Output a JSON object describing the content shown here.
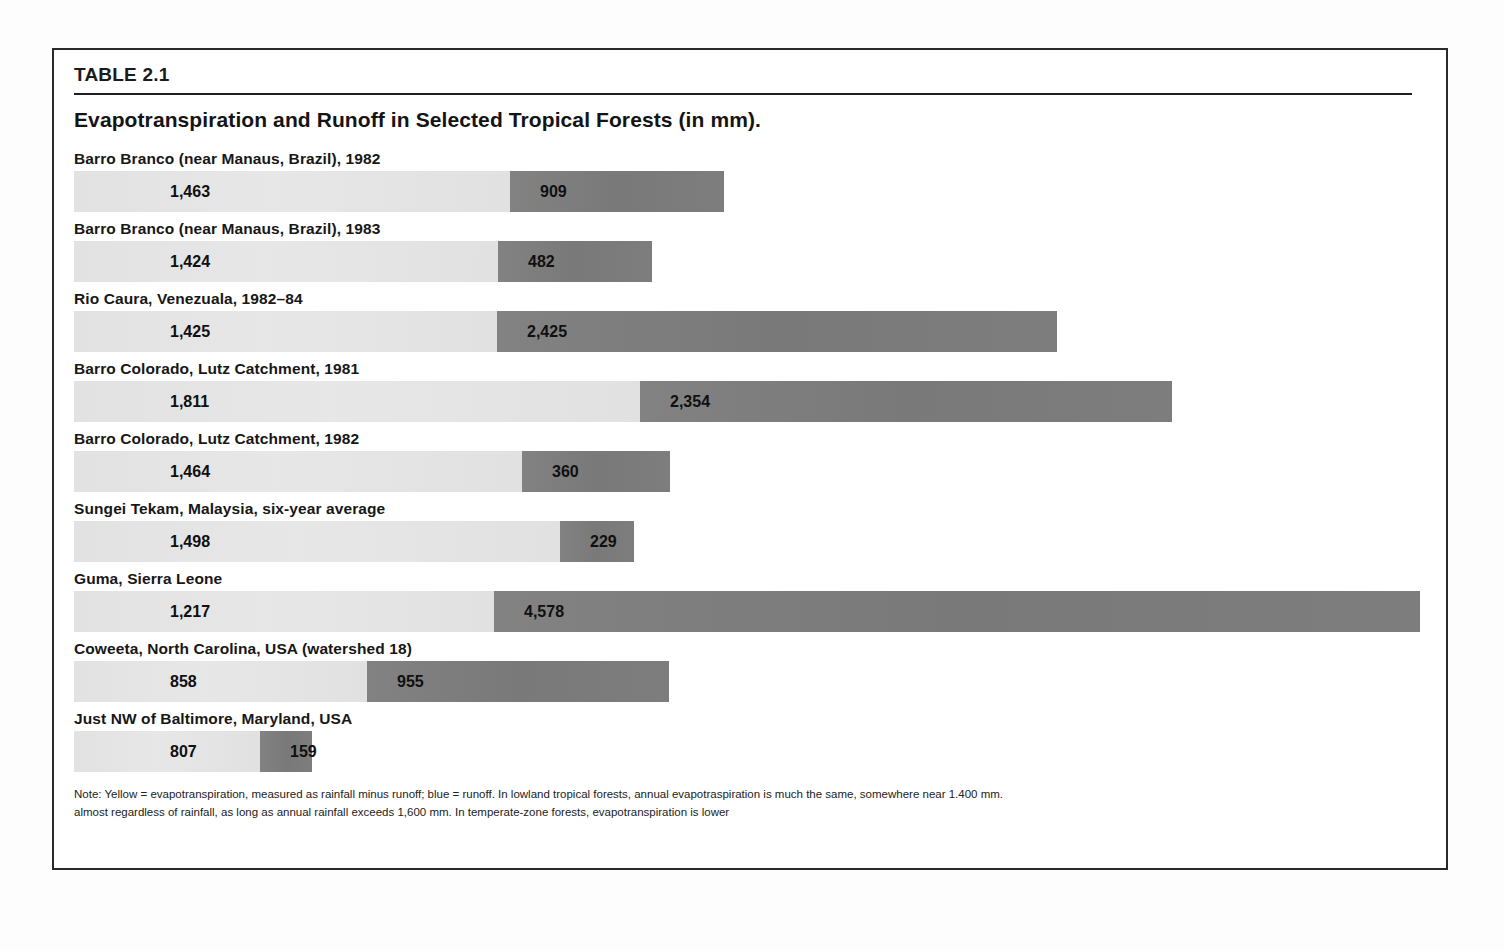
{
  "table": {
    "id_label": "TABLE 2.1",
    "title": "Evapotranspiration and Runoff in Selected Tropical Forests (in mm)."
  },
  "legend": {
    "evapotranspiration_color": "#e4e4e4",
    "runoff_color": "#7e7e7e"
  },
  "note": {
    "line1": "Note: Yellow = evapotranspiration, measured as rainfall minus runoff; blue = runoff. In lowland tropical forests, annual evapotraspiration is much the same, somewhere near 1.400 mm.",
    "line2": "almost regardless of rainfall, as long as annual rainfall exceeds 1,600 mm. In temperate-zone forests, evapotranspiration is lower"
  },
  "chart_data": {
    "type": "bar",
    "title": "Evapotranspiration and Runoff in Selected Tropical Forests (in mm).",
    "xlabel": "",
    "ylabel": "",
    "grid": false,
    "stacked": true,
    "orientation": "horizontal",
    "units": "mm",
    "legend": [
      "evapotranspiration",
      "runoff"
    ],
    "legend_position": "note",
    "categories": [
      "Barro Branco (near Manaus, Brazil), 1982",
      "Barro Branco (near Manaus, Brazil), 1983",
      "Rio Caura, Venezuala, 1982–84",
      "Barro Colorado, Lutz Catchment, 1981",
      "Barro Colorado, Lutz Catchment, 1982",
      "Sungei Tekam, Malaysia, six-year average",
      "Guma, Sierra Leone",
      "Coweeta, North Carolina, USA (watershed 18)",
      "Just NW of Baltimore, Maryland, USA"
    ],
    "series": [
      {
        "name": "evapotranspiration",
        "values": [
          1463,
          1424,
          1425,
          1811,
          1464,
          1498,
          1217,
          858,
          807
        ]
      },
      {
        "name": "runoff",
        "values": [
          909,
          482,
          2425,
          2354,
          360,
          229,
          4578,
          955,
          159
        ]
      }
    ],
    "rows": [
      {
        "label": "Barro Branco (near Manaus, Brazil), 1982",
        "et": 1463,
        "et_text": "1,463",
        "runoff": 909,
        "runoff_text": "909",
        "et_px": 436,
        "runoff_px": 214
      },
      {
        "label": "Barro Branco (near Manaus, Brazil), 1983",
        "et": 1424,
        "et_text": "1,424",
        "runoff": 482,
        "runoff_text": "482",
        "et_px": 424,
        "runoff_px": 154
      },
      {
        "label": "Rio Caura, Venezuala, 1982–84",
        "et": 1425,
        "et_text": "1,425",
        "runoff": 2425,
        "runoff_text": "2,425",
        "et_px": 423,
        "runoff_px": 560
      },
      {
        "label": "Barro Colorado, Lutz Catchment, 1981",
        "et": 1811,
        "et_text": "1,811",
        "runoff": 2354,
        "runoff_text": "2,354",
        "et_px": 566,
        "runoff_px": 532
      },
      {
        "label": "Barro Colorado, Lutz Catchment, 1982",
        "et": 1464,
        "et_text": "1,464",
        "runoff": 360,
        "runoff_text": "360",
        "et_px": 448,
        "runoff_px": 148
      },
      {
        "label": "Sungei Tekam, Malaysia, six-year average",
        "et": 1498,
        "et_text": "1,498",
        "runoff": 229,
        "runoff_text": "229",
        "et_px": 486,
        "runoff_px": 74
      },
      {
        "label": "Guma, Sierra Leone",
        "et": 1217,
        "et_text": "1,217",
        "runoff": 4578,
        "runoff_text": "4,578",
        "et_px": 420,
        "runoff_px": 926
      },
      {
        "label": "Coweeta, North Carolina, USA (watershed 18)",
        "et": 858,
        "et_text": "858",
        "runoff": 955,
        "runoff_text": "955",
        "et_px": 293,
        "runoff_px": 302
      },
      {
        "label": "Just NW of Baltimore, Maryland, USA",
        "et": 807,
        "et_text": "807",
        "runoff": 159,
        "runoff_text": "159",
        "et_px": 186,
        "runoff_px": 52
      }
    ]
  }
}
